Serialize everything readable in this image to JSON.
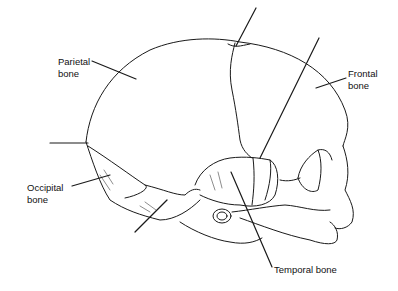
{
  "diagram": {
    "labels": {
      "parietal": {
        "line1": "Parietal",
        "line2": "bone"
      },
      "frontal": {
        "line1": "Frontal",
        "line2": "bone"
      },
      "occipital": {
        "line1": "Occipital",
        "line2": "bone"
      },
      "temporal": {
        "line1": "Temporal bone"
      }
    },
    "unlabeled_pointers": 4,
    "colors": {
      "line": "#1a1a1a",
      "background": "#ffffff",
      "text": "#111111"
    }
  }
}
